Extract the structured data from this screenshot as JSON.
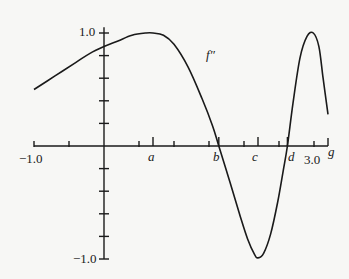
{
  "chart_data": {
    "type": "line",
    "title": "",
    "xlabel": "g",
    "ylabel": "",
    "xlim": [
      -1.0,
      3.2
    ],
    "ylim": [
      -1.0,
      1.0
    ],
    "grid": false,
    "legend": null,
    "x_tick_labels": [
      "-1.0",
      "3.0"
    ],
    "y_tick_labels": [
      "1.0",
      "-1.0"
    ],
    "x_ticks": [
      -1.0,
      -0.5,
      0.5,
      1.0,
      1.5,
      2.0,
      2.5,
      3.0
    ],
    "y_ticks": [
      -1.0,
      -0.8,
      -0.6,
      -0.4,
      -0.2,
      0.2,
      0.4,
      0.6,
      0.8,
      1.0
    ],
    "marked_points": [
      {
        "label": "a",
        "x": 0.7
      },
      {
        "label": "b",
        "x": 1.64
      },
      {
        "label": "c",
        "x": 2.2
      },
      {
        "label": "d",
        "x": 2.62
      }
    ],
    "series": [
      {
        "name": "f''",
        "x": [
          -1.0,
          -0.7,
          -0.4,
          -0.2,
          0.0,
          0.2,
          0.4,
          0.6,
          0.7,
          0.85,
          1.0,
          1.2,
          1.4,
          1.55,
          1.64,
          1.8,
          1.95,
          2.05,
          2.15,
          2.2,
          2.28,
          2.38,
          2.48,
          2.56,
          2.62,
          2.7,
          2.8,
          2.9,
          2.99,
          3.07,
          3.13,
          3.2
        ],
        "values": [
          0.5,
          0.62,
          0.74,
          0.82,
          0.88,
          0.93,
          0.98,
          1.0,
          1.0,
          0.98,
          0.9,
          0.7,
          0.42,
          0.18,
          0.0,
          -0.32,
          -0.63,
          -0.82,
          -0.96,
          -0.99,
          -0.95,
          -0.78,
          -0.5,
          -0.22,
          0.0,
          0.38,
          0.78,
          0.97,
          1.0,
          0.88,
          0.6,
          0.28
        ]
      }
    ],
    "annotations": [
      {
        "text": "f''",
        "x": 1.7,
        "y": 0.72
      }
    ]
  },
  "labels": {
    "y_top": "1.0",
    "y_bottom": "−1.0",
    "x_left": "−1.0",
    "x_right": "3.0",
    "x_axis_name": "g",
    "curve_name": "f″",
    "a": "a",
    "b": "b",
    "c": "c",
    "d": "d"
  }
}
